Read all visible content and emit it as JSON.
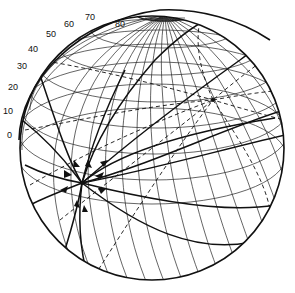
{
  "diagram": {
    "type": "globe-great-circles",
    "scale_labels": [
      {
        "text": "0",
        "x": 7,
        "y": 135
      },
      {
        "text": "10",
        "x": 12,
        "y": 110
      },
      {
        "text": "20",
        "x": 18,
        "y": 87
      },
      {
        "text": "30",
        "x": 28,
        "y": 65
      },
      {
        "text": "40",
        "x": 42,
        "y": 46
      },
      {
        "text": "50",
        "x": 58,
        "y": 32
      },
      {
        "text": "60",
        "x": 76,
        "y": 22
      },
      {
        "text": "70",
        "x": 93,
        "y": 14
      },
      {
        "text": "80",
        "x": 116,
        "y": 22
      }
    ],
    "colors": {
      "ink": "#111111",
      "background": "#ffffff"
    }
  }
}
